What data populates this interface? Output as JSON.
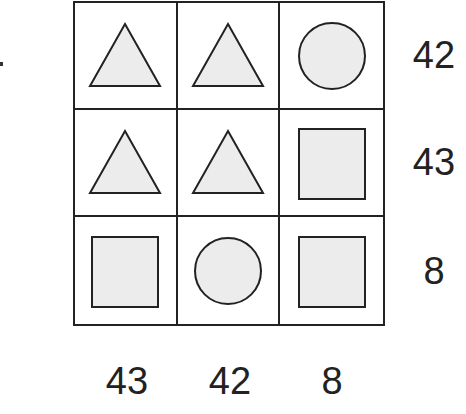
{
  "puzzle": {
    "fill_color": "#ececec",
    "stroke_color": "#222222",
    "grid": [
      [
        "triangle",
        "triangle",
        "circle"
      ],
      [
        "triangle",
        "triangle",
        "square"
      ],
      [
        "square",
        "circle",
        "square"
      ]
    ],
    "row_sums": [
      "42",
      "43",
      "8"
    ],
    "column_sums": [
      "43",
      "42",
      "8"
    ]
  }
}
